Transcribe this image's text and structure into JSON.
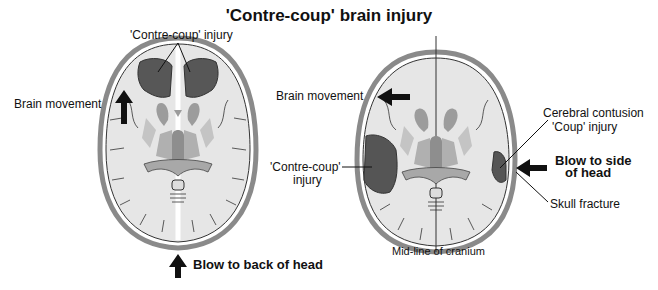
{
  "title": "'Contre-coup' brain injury",
  "left_diagram": {
    "label_contrecoup": "'Contre-coup' injury",
    "label_brain_movement": "Brain movement",
    "label_blow": "Blow to back of head"
  },
  "right_diagram": {
    "label_brain_movement": "Brain movement",
    "label_contrecoup_line1": "'Contre-coup'",
    "label_contrecoup_line2": "injury",
    "label_contusion_line1": "Cerebral contusion",
    "label_contusion_line2": "'Coup' injury",
    "label_blow_line1": "Blow to side",
    "label_blow_line2": "of head",
    "label_fracture": "Skull fracture",
    "label_midline": "Mid-line of cranium"
  },
  "colors": {
    "skull": "#9a9a9a",
    "brain": "#e6e6e6",
    "injury": "#555555",
    "structure_mid": "#9c9c9c",
    "structure_light": "#bcbcbc",
    "ink": "#111111"
  }
}
